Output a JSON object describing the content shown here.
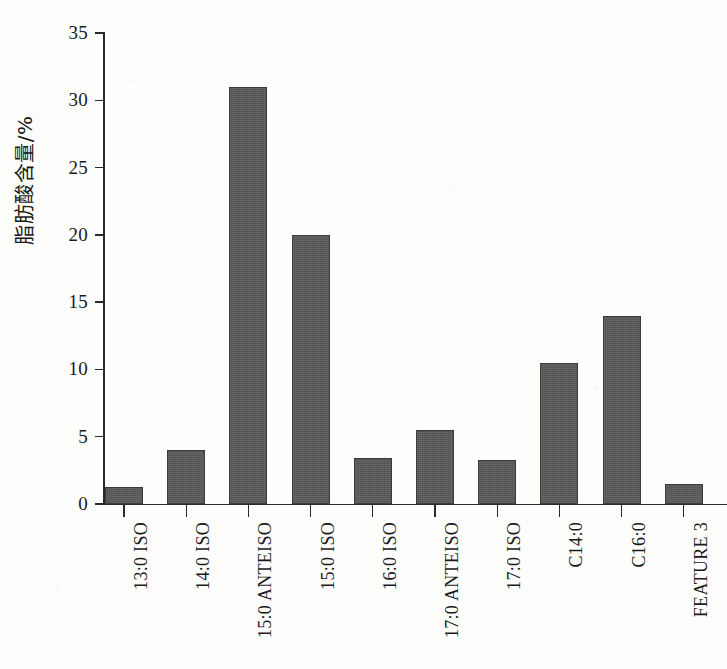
{
  "chart_data": {
    "type": "bar",
    "title": "",
    "xlabel": "",
    "ylabel": "脂肪酸含量/%",
    "ylim": [
      0,
      35
    ],
    "ytick_values": [
      0,
      5,
      10,
      15,
      20,
      25,
      30,
      35
    ],
    "ytick_labels": [
      "0",
      "5",
      "10",
      "15",
      "20",
      "25",
      "30",
      "35"
    ],
    "grid": false,
    "legend": "none",
    "bar_color": "#59595a",
    "axis_color": "#2a2a2a",
    "categories": [
      "13:0 ISO",
      "14:0 ISO",
      "15:0 ANTEISO",
      "15:0 ISO",
      "16:0 ISO",
      "17:0 ANTEISO",
      "17:0 ISO",
      "C14:0",
      "C16:0",
      "FEATURE 3"
    ],
    "values": [
      1.3,
      4.0,
      31.0,
      20.0,
      3.4,
      5.5,
      3.3,
      10.5,
      14.0,
      1.5
    ]
  }
}
